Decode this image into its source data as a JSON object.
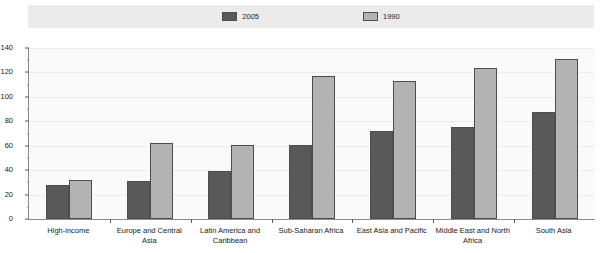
{
  "chart_data": {
    "type": "bar",
    "title": "",
    "xlabel": "",
    "ylabel": "",
    "ylim": [
      0,
      140
    ],
    "ytick_step": 20,
    "yminor_step": 10,
    "grid": true,
    "legend_position": "top",
    "ytick_labels": [
      "0",
      "20",
      "40",
      "60",
      "80",
      "100",
      "120",
      "140"
    ],
    "ytick_values": [
      0,
      20,
      40,
      60,
      80,
      100,
      120,
      140
    ],
    "categories": [
      "High-income",
      "Europe and Central Asia",
      "Latin America and\nCaribbean",
      "Sub-Saharan Africa",
      "East Asia and Pacific",
      "Middle East and North\nAfrica",
      "South Asia"
    ],
    "series": [
      {
        "name": "2005",
        "color": "#595959",
        "values": [
          28,
          31,
          39,
          61,
          72,
          75,
          88
        ]
      },
      {
        "name": "1990",
        "color": "#b3b3b3",
        "values": [
          32,
          62,
          61,
          117,
          113,
          124,
          131
        ]
      }
    ]
  },
  "legend": {
    "items": [
      {
        "label": "2005",
        "color": "#595959"
      },
      {
        "label": "1990",
        "color": "#b3b3b3"
      }
    ]
  }
}
